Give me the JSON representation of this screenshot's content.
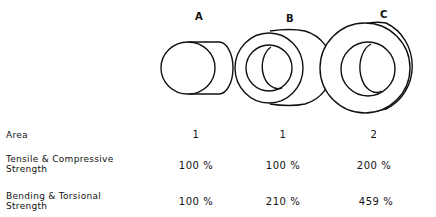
{
  "columns": [
    {
      "id": "A",
      "label": "A"
    },
    {
      "id": "B",
      "label": "B"
    },
    {
      "id": "C",
      "label": "C"
    }
  ],
  "shapes": [
    {
      "id": "A",
      "type": "solid-cylinder",
      "description": "solid rod"
    },
    {
      "id": "B",
      "type": "hollow-tube",
      "description": "thin-wall tube, same area"
    },
    {
      "id": "C",
      "type": "hollow-tube",
      "description": "larger tube, double area"
    }
  ],
  "rows": [
    {
      "label": "Area",
      "values": [
        "1",
        "1",
        "2"
      ]
    },
    {
      "label": "Tensile & Compressive\nStrength",
      "label_line1": "Tensile & Compressive",
      "label_line2": "Strength",
      "values": [
        "100 %",
        "100 %",
        "200 %"
      ]
    },
    {
      "label": "Bending & Torsional\nStrength",
      "label_line1": "Bending & Torsional",
      "label_line2": "Strength",
      "values": [
        "100 %",
        "210 %",
        "459 %"
      ]
    }
  ],
  "colors": {
    "stroke": "#111111",
    "background": "#ffffff"
  }
}
